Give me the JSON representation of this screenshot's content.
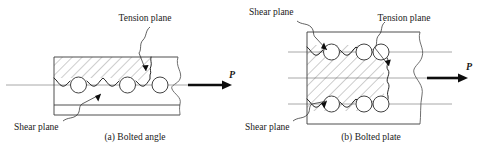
{
  "figure": {
    "colors": {
      "outline": "#3a3a3a",
      "gage_line": "#8c8c8c",
      "hatch": "#4a4a4a",
      "failure_path": "#1c1c1c",
      "arrow": "#0d0d0d",
      "background": "#ffffff",
      "text": "#1a1a1a"
    }
  },
  "panels": [
    {
      "id": "bolted-angle",
      "caption": "(a) Bolted angle",
      "force_label": "P",
      "bolt_count": 3,
      "bolt_rows": 1,
      "labels": {
        "tension_plane": "Tension plane",
        "shear_plane": "Shear plane"
      }
    },
    {
      "id": "bolted-plate",
      "caption": "(b) Bolted plate",
      "force_label": "P",
      "bolt_count": 6,
      "bolt_rows": 2,
      "labels": {
        "shear_plane_top": "Shear plane",
        "tension_plane": "Tension plane",
        "shear_plane_bottom": "Shear plane"
      }
    }
  ]
}
